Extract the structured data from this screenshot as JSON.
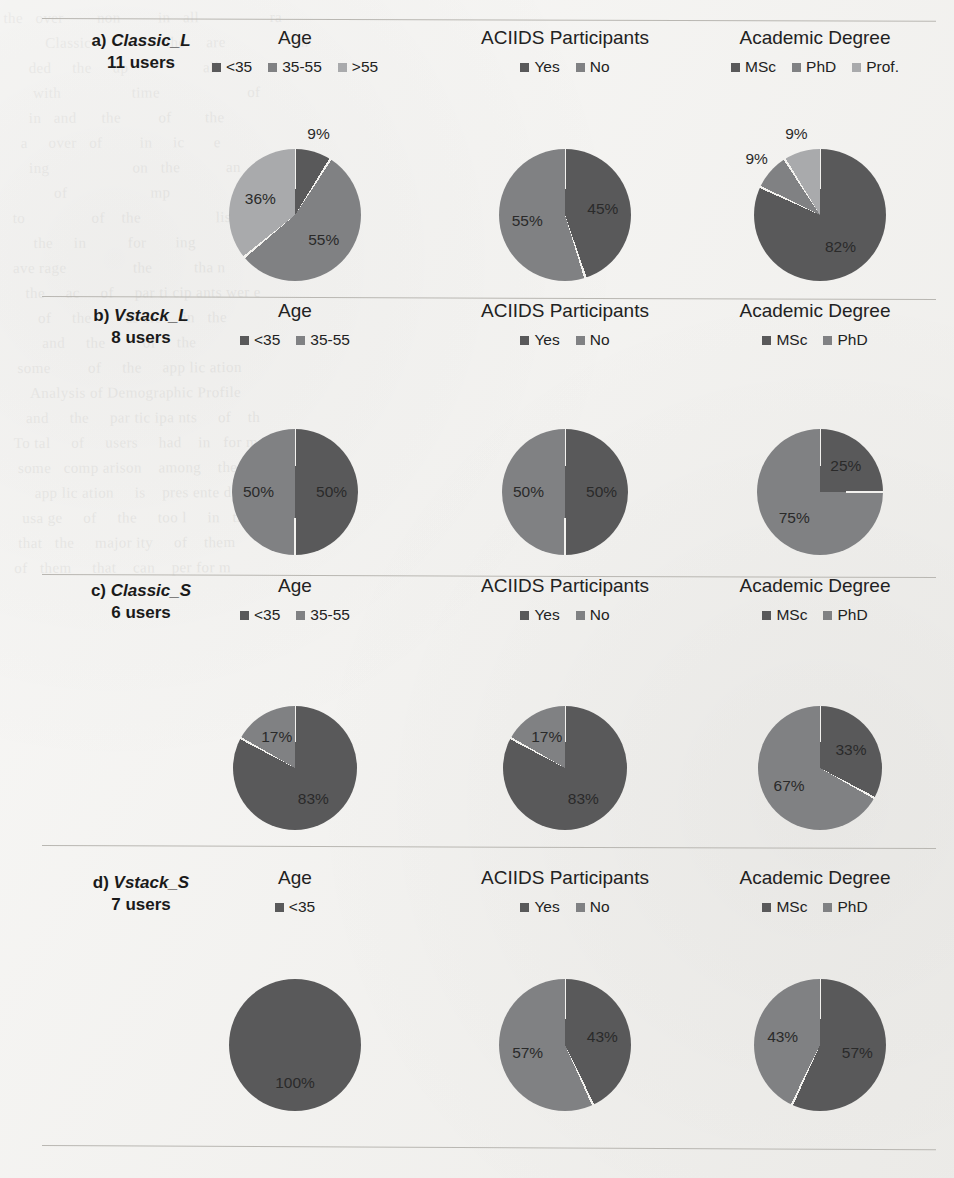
{
  "figure": {
    "colors": {
      "series1_dark": "#59595a",
      "series2_mid": "#808183",
      "series3_light": "#a9aaac",
      "slice_gap": "#f2f1ee",
      "separator": "#b9b7b2",
      "page_background": "#f2f1ee"
    },
    "column_titles": [
      "Age",
      "ACIIDS Participants",
      "Academic Degree"
    ],
    "bleed_text": "the   over        non         in   all                 ra\n          Classic                  the     are                 th\n      ded     the     up                  all\n       with                 time                     of\n      in   and      the         of        the\n    a     over   of         in     ic       e\n      ing                    on   the           an\n            of                    mp                ad\n  to                of    the                  lis\n       the     in          for       ing\n  ave rage                the          tha n\n     the     ac     of     par ti cip ants wer e\n        of     the        us ers     in   the\n         and     the         of     the\n   some         of     the     app lic ation\n      Analysis of Demographic Profile\n     and     the     par tic ipa nts     of    th\n  To tal     of     users     had    in   for mat ion\n   some   comp arison    among    the     g\n       app lic ation     is    pres ente d\n    usa ge     of     the     too l     in   the\n   that   the     major ity     of    them\n  of   them     that    can    per for m"
  },
  "rows": [
    {
      "id": "a",
      "label_prefix": "a)",
      "name": "Classic_L",
      "users": "11 users",
      "charts": [
        {
          "title": "Age",
          "chart_data": {
            "type": "pie",
            "title": "Age",
            "categories": [
              "<35",
              "35-55",
              ">55"
            ],
            "values": [
              9,
              55,
              36
            ],
            "labels": [
              "9%",
              "55%",
              "36%"
            ],
            "legend_position": "top"
          }
        },
        {
          "title": "ACIIDS Participants",
          "chart_data": {
            "type": "pie",
            "title": "ACIIDS Participants",
            "categories": [
              "Yes",
              "No"
            ],
            "values": [
              45,
              55
            ],
            "labels": [
              "45%",
              "55%"
            ],
            "legend_position": "top"
          }
        },
        {
          "title": "Academic Degree",
          "chart_data": {
            "type": "pie",
            "title": "Academic Degree",
            "categories": [
              "MSc",
              "PhD",
              "Prof."
            ],
            "values": [
              82,
              9,
              9
            ],
            "labels": [
              "82%",
              "9%",
              "9%"
            ],
            "legend_position": "top"
          }
        }
      ]
    },
    {
      "id": "b",
      "label_prefix": "b)",
      "name": "Vstack_L",
      "users": "8 users",
      "charts": [
        {
          "title": "Age",
          "chart_data": {
            "type": "pie",
            "title": "Age",
            "categories": [
              "<35",
              "35-55"
            ],
            "values": [
              50,
              50
            ],
            "labels": [
              "50%",
              "50%"
            ],
            "legend_position": "top"
          }
        },
        {
          "title": "ACIIDS Participants",
          "chart_data": {
            "type": "pie",
            "title": "ACIIDS Participants",
            "categories": [
              "Yes",
              "No"
            ],
            "values": [
              50,
              50
            ],
            "labels": [
              "50%",
              "50%"
            ],
            "legend_position": "top"
          }
        },
        {
          "title": "Academic Degree",
          "chart_data": {
            "type": "pie",
            "title": "Academic Degree",
            "categories": [
              "MSc",
              "PhD"
            ],
            "values": [
              25,
              75
            ],
            "labels": [
              "25%",
              "75%"
            ],
            "legend_position": "top"
          }
        }
      ]
    },
    {
      "id": "c",
      "label_prefix": "c)",
      "name": "Classic_S",
      "users": "6 users",
      "charts": [
        {
          "title": "Age",
          "chart_data": {
            "type": "pie",
            "title": "Age",
            "categories": [
              "<35",
              "35-55"
            ],
            "values": [
              83,
              17
            ],
            "labels": [
              "83%",
              "17%"
            ],
            "legend_position": "top"
          }
        },
        {
          "title": "ACIIDS Participants",
          "chart_data": {
            "type": "pie",
            "title": "ACIIDS Participants",
            "categories": [
              "Yes",
              "No"
            ],
            "values": [
              83,
              17
            ],
            "labels": [
              "83%",
              "17%"
            ],
            "legend_position": "top"
          }
        },
        {
          "title": "Academic Degree",
          "chart_data": {
            "type": "pie",
            "title": "Academic Degree",
            "categories": [
              "MSc",
              "PhD"
            ],
            "values": [
              33,
              67
            ],
            "labels": [
              "33%",
              "67%"
            ],
            "legend_position": "top"
          }
        }
      ]
    },
    {
      "id": "d",
      "label_prefix": "d)",
      "name": "Vstack_S",
      "users": "7 users",
      "charts": [
        {
          "title": "Age",
          "chart_data": {
            "type": "pie",
            "title": "Age",
            "categories": [
              "<35"
            ],
            "values": [
              100
            ],
            "labels": [
              "100%"
            ],
            "legend_position": "top"
          }
        },
        {
          "title": "ACIIDS Participants",
          "chart_data": {
            "type": "pie",
            "title": "ACIIDS Participants",
            "categories": [
              "Yes",
              "No"
            ],
            "values": [
              43,
              57
            ],
            "labels": [
              "43%",
              "57%"
            ],
            "legend_position": "top"
          }
        },
        {
          "title": "Academic Degree",
          "chart_data": {
            "type": "pie",
            "title": "Academic Degree",
            "categories": [
              "MSc",
              "PhD"
            ],
            "values": [
              57,
              43
            ],
            "labels": [
              "57%",
              "43%"
            ],
            "legend_position": "top"
          }
        }
      ]
    }
  ]
}
